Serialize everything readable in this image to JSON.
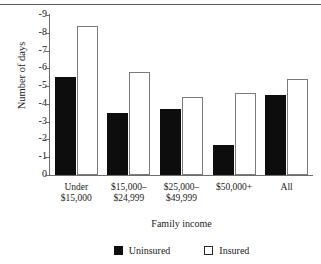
{
  "chart_data": {
    "type": "bar",
    "title": "",
    "xlabel": "Family income",
    "ylabel": "Number of days",
    "categories": [
      "Under\n$15,000",
      "$15,000–\n$24,999",
      "$25,000–\n$49,999",
      "$50,000+",
      "All"
    ],
    "category_lines": [
      [
        "Under",
        "$15,000"
      ],
      [
        "$15,000–",
        "$24,999"
      ],
      [
        "$25,000–",
        "$49,999"
      ],
      [
        "$50,000+",
        ""
      ],
      [
        "All",
        ""
      ]
    ],
    "series": [
      {
        "name": "Uninsured",
        "color": "#0d0d0d",
        "values": [
          5.5,
          3.5,
          3.7,
          1.7,
          4.5
        ]
      },
      {
        "name": "Insured",
        "color": "#ffffff",
        "values": [
          8.4,
          5.8,
          4.4,
          4.6,
          5.4
        ]
      }
    ],
    "ylim": [
      0,
      9
    ],
    "ytick_labels": [
      "-9",
      "-8",
      "-7",
      "-6",
      "-5",
      "-4",
      "-3",
      "-2",
      "-1",
      "0"
    ],
    "ytick_values": [
      9,
      8,
      7,
      6,
      5,
      4,
      3,
      2,
      1,
      0
    ],
    "grid": false,
    "legend_position": "bottom"
  },
  "legend": {
    "items": [
      {
        "label": "Uninsured",
        "swatch": "filled-square-icon"
      },
      {
        "label": "Insured",
        "swatch": "hollow-square-icon"
      }
    ]
  }
}
